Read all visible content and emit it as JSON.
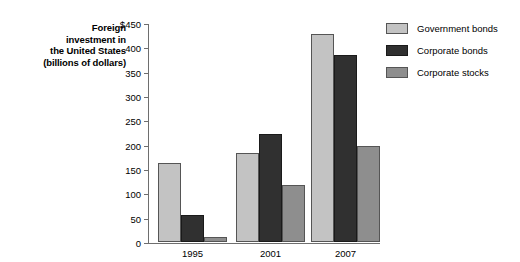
{
  "chart_data": {
    "type": "bar",
    "title": "Foreign investment in the United States (billions of dollars)",
    "title_lines": [
      "Foreign",
      "investment in",
      "the United States",
      "(billions of dollars)"
    ],
    "xlabel": "",
    "ylabel": "",
    "ylim": [
      0,
      450
    ],
    "yticks": [
      0,
      50,
      100,
      150,
      200,
      250,
      300,
      350,
      400,
      450
    ],
    "ytick_labels": [
      "0",
      "50",
      "100",
      "150",
      "200",
      "250",
      "300",
      "350",
      "400",
      "$450"
    ],
    "grid": false,
    "legend_position": "right",
    "categories": [
      "1995",
      "2001",
      "2007"
    ],
    "series": [
      {
        "name": "Government bonds",
        "color": "#c3c3c3",
        "values": [
          163,
          183,
          428
        ]
      },
      {
        "name": "Corporate bonds",
        "color": "#303030",
        "values": [
          55,
          222,
          385
        ]
      },
      {
        "name": "Corporate stocks",
        "color": "#8e8e8e",
        "values": [
          10,
          117,
          197
        ]
      }
    ]
  }
}
